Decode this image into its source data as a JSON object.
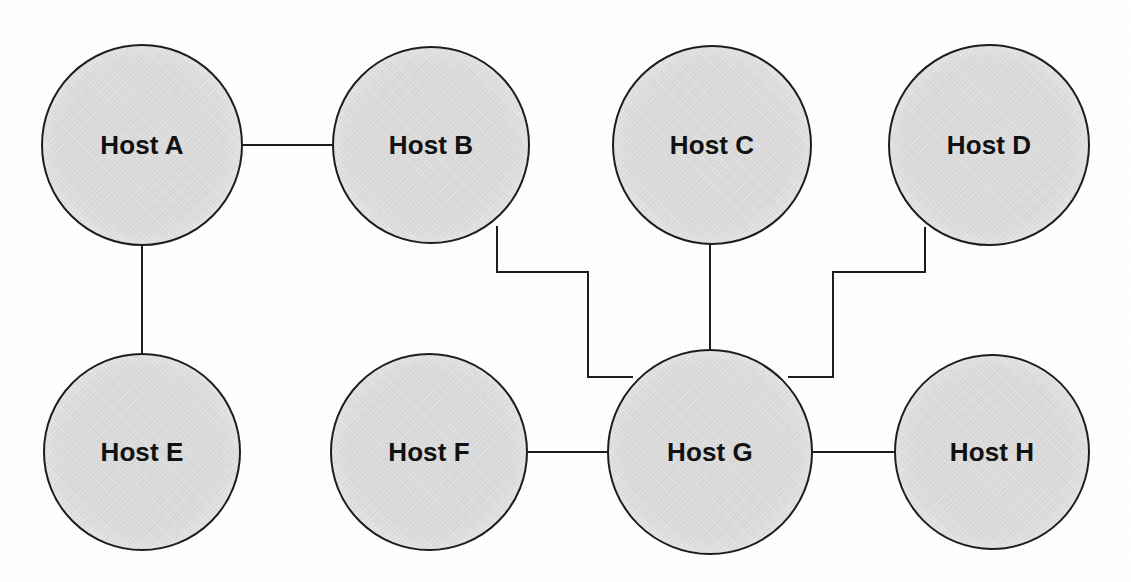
{
  "diagram": {
    "type": "network-topology",
    "canvas": {
      "width": 1131,
      "height": 582
    },
    "style": {
      "background_color": "#ffffff",
      "node_fill_color": "#dbdbdb",
      "node_stroke_color": "#1d1d1d",
      "node_stroke_width": 2,
      "edge_color": "#1d1d1d",
      "edge_width": 2,
      "label_color": "#111111",
      "label_font_size": 26
    },
    "nodes": [
      {
        "id": "A",
        "label": "Host A",
        "cx": 142,
        "cy": 145,
        "r": 101
      },
      {
        "id": "B",
        "label": "Host B",
        "cx": 431,
        "cy": 145,
        "r": 99
      },
      {
        "id": "C",
        "label": "Host C",
        "cx": 712,
        "cy": 145,
        "r": 100
      },
      {
        "id": "D",
        "label": "Host D",
        "cx": 989,
        "cy": 145,
        "r": 101
      },
      {
        "id": "E",
        "label": "Host E",
        "cx": 142,
        "cy": 452,
        "r": 99
      },
      {
        "id": "F",
        "label": "Host F",
        "cx": 429,
        "cy": 452,
        "r": 99
      },
      {
        "id": "G",
        "label": "Host G",
        "cx": 710,
        "cy": 452,
        "r": 103
      },
      {
        "id": "H",
        "label": "Host H",
        "cx": 992,
        "cy": 452,
        "r": 98
      }
    ],
    "edges": [
      {
        "id": "edge-a-b",
        "from": "A",
        "to": "B",
        "kind": "straight",
        "points": "243,145 332,145"
      },
      {
        "id": "edge-a-e",
        "from": "A",
        "to": "E",
        "kind": "straight",
        "points": "142,246 142,353"
      },
      {
        "id": "edge-b-g",
        "from": "B",
        "to": "G",
        "kind": "orthogonal",
        "points": "497,227 497,272 588,272 588,377 632,377"
      },
      {
        "id": "edge-c-g",
        "from": "C",
        "to": "G",
        "kind": "straight",
        "points": "710,245 710,349"
      },
      {
        "id": "edge-d-g",
        "from": "D",
        "to": "G",
        "kind": "orthogonal",
        "points": "925,228 925,272 833,272 833,377 789,377"
      },
      {
        "id": "edge-f-g",
        "from": "F",
        "to": "G",
        "kind": "straight",
        "points": "528,452 607,452"
      },
      {
        "id": "edge-g-h",
        "from": "G",
        "to": "H",
        "kind": "straight",
        "points": "813,452 894,452"
      }
    ]
  }
}
